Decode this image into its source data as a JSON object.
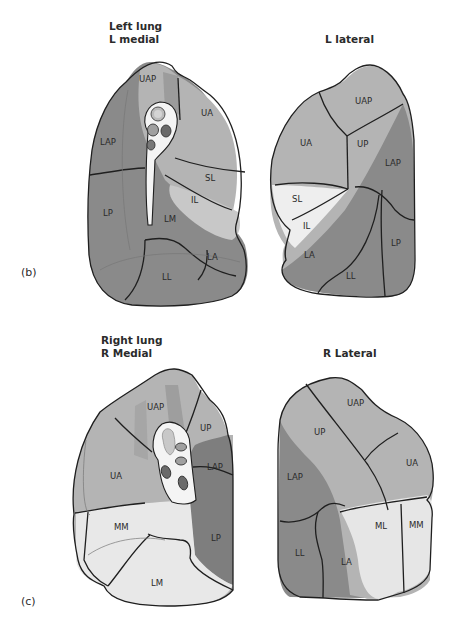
{
  "figure": {
    "panel_b": {
      "label": "(b)",
      "medial": {
        "title_line1": "Left lung",
        "title_line2": "L medial",
        "segments": [
          "UAP",
          "UA",
          "LAP",
          "SL",
          "IL",
          "LP",
          "LM",
          "LA",
          "LL"
        ]
      },
      "lateral": {
        "title": "L lateral",
        "segments": [
          "UAP",
          "UA",
          "UP",
          "LAP",
          "SL",
          "IL",
          "LP",
          "LA",
          "LL"
        ]
      }
    },
    "panel_c": {
      "label": "(c)",
      "medial": {
        "title_line1": "Right lung",
        "title_line2": "R Medial",
        "segments": [
          "UAP",
          "UP",
          "UA",
          "LAP",
          "MM",
          "LP",
          "LM"
        ]
      },
      "lateral": {
        "title": "R Lateral",
        "segments": [
          "UAP",
          "UP",
          "UA",
          "LAP",
          "ML",
          "MM",
          "LL",
          "LA"
        ]
      }
    },
    "colors": {
      "upper_lobe": "#b4b4b4",
      "lower_lobe": "#8a8a8a",
      "lingula_middle": "#e6e6e6",
      "hilum": "#f4f4f4",
      "outline": "#1f1f1f"
    }
  }
}
